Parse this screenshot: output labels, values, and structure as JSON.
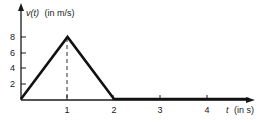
{
  "chart_data": {
    "type": "line",
    "title": "",
    "ylabel": "v(t) (in m/s)",
    "ylabel_var": "v(t)",
    "ylabel_unit": "(in m/s)",
    "xlabel": "t (in s)",
    "xlabel_var": "t",
    "xlabel_unit": "(in s)",
    "x": [
      0,
      1,
      2,
      3,
      4,
      4.9
    ],
    "series": [
      {
        "name": "v(t)",
        "values": [
          0,
          8,
          0,
          0,
          0,
          0
        ]
      }
    ],
    "xticks": [
      "1",
      "2",
      "3",
      "4"
    ],
    "yticks": [
      "2",
      "4",
      "6",
      "8"
    ],
    "xlim": [
      0,
      5
    ],
    "ylim": [
      0,
      10
    ],
    "grid": false,
    "legend": "none",
    "annotations": [
      {
        "type": "dashed-vertical-line",
        "x": 1,
        "from_y": 0,
        "to_y": 8
      }
    ]
  }
}
